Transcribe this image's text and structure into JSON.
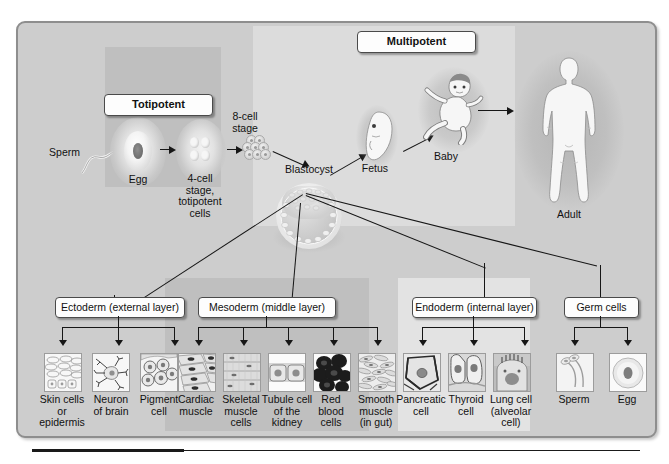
{
  "diagram": {
    "frame_bg": "#cdcdcd",
    "zones": [
      {
        "id": "totipotent",
        "label": "Totipotent",
        "bg": "#bfbfbf"
      },
      {
        "id": "multipotent",
        "label": "Multipotent",
        "bg": "#dcdcdc"
      },
      {
        "id": "mesoderm_band",
        "label": "",
        "bg": "#bfbfbf"
      },
      {
        "id": "endoderm_band",
        "label": "",
        "bg": "#e3e3e3"
      }
    ]
  },
  "top_row": {
    "sperm_label": "Sperm",
    "egg_label": "Egg",
    "four_cell_label": "4-cell\nstage,\ntotipotent\ncells",
    "eight_cell_label": "8-cell\nstage",
    "blastocyst_label": "Blastocyst"
  },
  "multipotent_row": {
    "fetus_label": "Fetus",
    "baby_label": "Baby",
    "adult_label": "Adult"
  },
  "germ_layers": [
    {
      "id": "ectoderm",
      "label": "Ectoderm (external layer)",
      "cells": [
        {
          "name": "skin-cells",
          "label": "Skin cells\nor\nepidermis",
          "icon": "epithelium-icon"
        },
        {
          "name": "neuron",
          "label": "Neuron\nof brain",
          "icon": "neuron-icon"
        },
        {
          "name": "pigment-cell",
          "label": "Pigment\ncell",
          "icon": "pigment-cell-icon"
        }
      ]
    },
    {
      "id": "mesoderm",
      "label": "Mesoderm (middle layer)",
      "cells": [
        {
          "name": "cardiac-muscle",
          "label": "Cardiac\nmuscle",
          "icon": "cardiac-muscle-icon"
        },
        {
          "name": "skeletal-muscle",
          "label": "Skeletal\nmuscle\ncells",
          "icon": "skeletal-muscle-icon"
        },
        {
          "name": "tubule-cell",
          "label": "Tubule cell\nof the\nkidney",
          "icon": "tubule-cell-icon"
        },
        {
          "name": "red-blood-cells",
          "label": "Red\nblood\ncells",
          "icon": "red-blood-cell-icon"
        },
        {
          "name": "smooth-muscle",
          "label": "Smooth\nmuscle\n(in gut)",
          "icon": "smooth-muscle-icon"
        }
      ]
    },
    {
      "id": "endoderm",
      "label": "Endoderm (internal layer)",
      "cells": [
        {
          "name": "pancreatic-cell",
          "label": "Pancreatic\ncell",
          "icon": "pancreatic-cell-icon"
        },
        {
          "name": "thyroid-cell",
          "label": "Thyroid\ncell",
          "icon": "thyroid-cell-icon"
        },
        {
          "name": "lung-cell",
          "label": "Lung cell\n(alveolar\ncell)",
          "icon": "alveolar-cell-icon"
        }
      ]
    },
    {
      "id": "germ-cells",
      "label": "Germ cells",
      "cells": [
        {
          "name": "sperm-cell",
          "label": "Sperm",
          "icon": "sperm-icon"
        },
        {
          "name": "egg-cell",
          "label": "Egg",
          "icon": "egg-icon"
        }
      ]
    }
  ]
}
